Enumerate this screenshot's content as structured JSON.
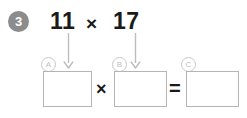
{
  "question": {
    "number": "3",
    "expression": {
      "left_operand": "11",
      "operator": "×",
      "right_operand": "17"
    }
  },
  "arrows": [
    {
      "name": "arrow-to-box-a",
      "points_to": "A"
    },
    {
      "name": "arrow-to-box-b",
      "points_to": "B"
    }
  ],
  "part_labels": {
    "a": "A",
    "b": "B",
    "c": "C"
  },
  "answer_row": {
    "box_a_value": "",
    "box_a_placeholder": "",
    "operator_times": "×",
    "box_b_value": "",
    "box_b_placeholder": "",
    "operator_equals": "=",
    "box_c_value": "",
    "box_c_placeholder": ""
  },
  "colors": {
    "badge_fill": "#8c8c8c",
    "badge_text": "#ffffff",
    "expression_text": "#1a1a1a",
    "box_border": "#b5b5b5",
    "label_border": "#c8c8c8",
    "label_text": "#c0c0c0",
    "arrow_stroke": "#bdbdbd",
    "page_background": "#ffffff"
  }
}
